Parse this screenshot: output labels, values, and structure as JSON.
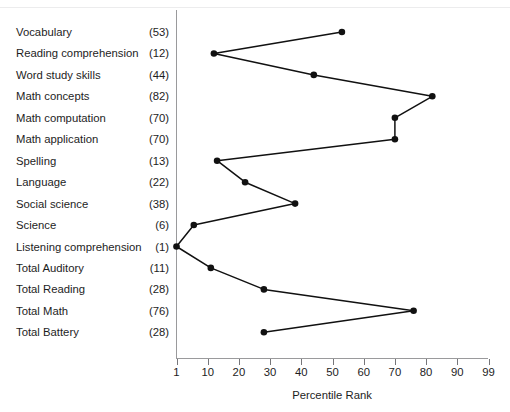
{
  "chart_data": {
    "type": "line",
    "title": "",
    "subtitle": "",
    "xlabel": "Percentile Rank",
    "ylabel": "",
    "orientation": "horizontal",
    "grid": false,
    "legend": null,
    "xticks": [
      "1",
      "10",
      "20",
      "30",
      "40",
      "50",
      "60",
      "70",
      "80",
      "90",
      "99"
    ],
    "xtick_positions_note": "evenly spaced categorical ticks",
    "xlim": [
      1,
      99
    ],
    "categories": [
      "Vocabulary",
      "Reading comprehension",
      "Word study skills",
      "Math concepts",
      "Math computation",
      "Math application",
      "Spelling",
      "Language",
      "Social science",
      "Science",
      "Listening comprehension",
      "Total Auditory",
      "Total Reading",
      "Total Math",
      "Total Battery"
    ],
    "values": [
      53,
      12,
      44,
      82,
      70,
      70,
      13,
      22,
      38,
      6,
      1,
      11,
      28,
      76,
      28
    ],
    "value_labels": [
      "(53)",
      "(12)",
      "(44)",
      "(82)",
      "(70)",
      "(70)",
      "(13)",
      "(22)",
      "(38)",
      "(6)",
      "(1)",
      "(11)",
      "(28)",
      "(76)",
      "(28)"
    ],
    "marker": "filled-circle",
    "line_color": "#111111",
    "marker_color": "#111111"
  },
  "axis": {
    "x_title": "Percentile Rank",
    "ticks": [
      "1",
      "10",
      "20",
      "30",
      "40",
      "50",
      "60",
      "70",
      "80",
      "90",
      "99"
    ]
  },
  "rows": [
    {
      "name": "Vocabulary",
      "score": "(53)",
      "value": 53
    },
    {
      "name": "Reading comprehension",
      "score": "(12)",
      "value": 12
    },
    {
      "name": "Word study skills",
      "score": "(44)",
      "value": 44
    },
    {
      "name": "Math concepts",
      "score": "(82)",
      "value": 82
    },
    {
      "name": "Math computation",
      "score": "(70)",
      "value": 70
    },
    {
      "name": "Math application",
      "score": "(70)",
      "value": 70
    },
    {
      "name": "Spelling",
      "score": "(13)",
      "value": 13
    },
    {
      "name": "Language",
      "score": "(22)",
      "value": 22
    },
    {
      "name": "Social science",
      "score": "(38)",
      "value": 38
    },
    {
      "name": "Science",
      "score": "(6)",
      "value": 6
    },
    {
      "name": "Listening comprehension",
      "score": "(1)",
      "value": 1
    },
    {
      "name": "Total Auditory",
      "score": "(11)",
      "value": 11
    },
    {
      "name": "Total Reading",
      "score": "(28)",
      "value": 28
    },
    {
      "name": "Total Math",
      "score": "(76)",
      "value": 76
    },
    {
      "name": "Total Battery",
      "score": "(28)",
      "value": 28
    }
  ],
  "colors": {
    "line": "#111111",
    "marker": "#111111",
    "axis": "#9a9a9c",
    "text": "#1d1d1d"
  }
}
